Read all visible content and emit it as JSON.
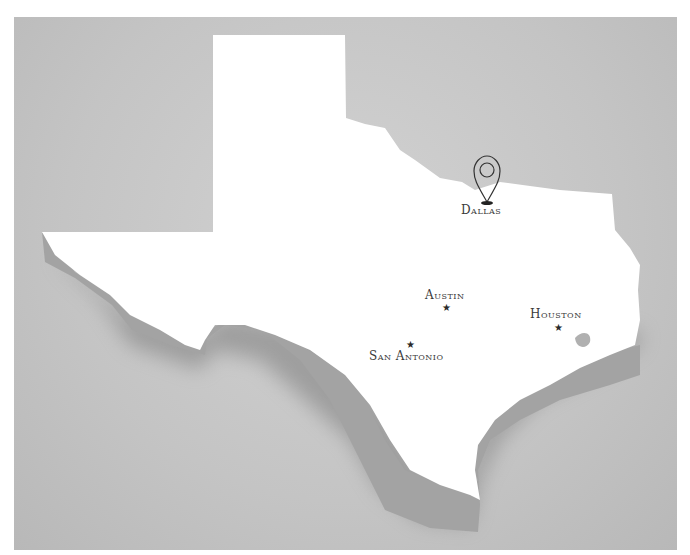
{
  "map": {
    "title": "Texas",
    "background_color": "#c6c6c6",
    "land_color": "#ffffff",
    "extrusion_color": "#9e9e9e",
    "cities": [
      {
        "name": "Dallas",
        "marker": "map-pin-icon",
        "x": 487,
        "y": 186
      },
      {
        "name": "Austin",
        "marker": "star-icon",
        "x": 447,
        "y": 307
      },
      {
        "name": "San Antonio",
        "marker": "star-icon",
        "x": 412,
        "y": 344
      },
      {
        "name": "Houston",
        "marker": "star-icon",
        "x": 559,
        "y": 328
      }
    ]
  },
  "labels": {
    "dallas": "Dallas",
    "austin": "Austin",
    "san_antonio": "San Antonio",
    "houston": "Houston"
  },
  "icons": {
    "star": "★"
  }
}
